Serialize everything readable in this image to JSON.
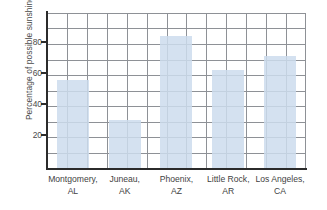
{
  "chart_data": {
    "type": "bar",
    "title": "",
    "xlabel": "",
    "ylabel": "Percentage of possible sunshine",
    "categories": [
      "Montgomery, AL",
      "Juneau, AK",
      "Phoenix, AZ",
      "Little Rock, AR",
      "Los Angeles, CA"
    ],
    "category_cities": [
      "Montgomery,",
      "Juneau,",
      "Phoenix,",
      "Little Rock,",
      "Los Angeles,"
    ],
    "category_states": [
      "AL",
      "AK",
      "AZ",
      "AR",
      "CA"
    ],
    "values": [
      57,
      31,
      85,
      63,
      72
    ],
    "ylim": [
      0,
      100
    ],
    "yticks": [
      20,
      40,
      60,
      80
    ],
    "ytick_labels": [
      "20",
      "40",
      "60",
      "80"
    ],
    "y_gridlines": [
      10,
      20,
      30,
      40,
      50,
      60,
      70,
      80,
      90,
      100
    ],
    "grid": true,
    "legend": "none",
    "bar_color": "#ccdced",
    "grid_color": "#8e9196",
    "axis_color": "#2b2b2b"
  }
}
